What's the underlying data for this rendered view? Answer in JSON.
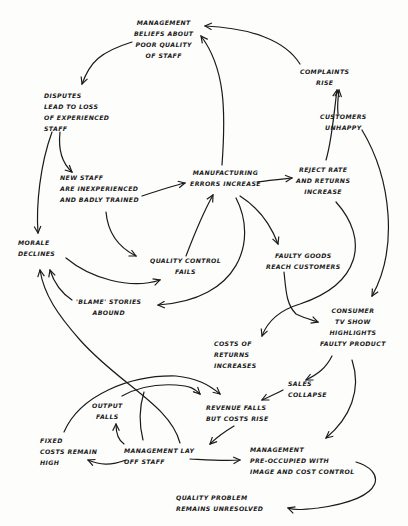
{
  "diagram": {
    "type": "causal-loop sketch",
    "nodes": [
      {
        "id": "mgmt_beliefs",
        "label": "Management\nbeliefs about\npoor quality\nof staff"
      },
      {
        "id": "disputes",
        "label": "Disputes\nlead to loss\nof experienced\nstaff"
      },
      {
        "id": "complaints",
        "label": "Complaints\nrise"
      },
      {
        "id": "customers",
        "label": "Customers\nunhappy"
      },
      {
        "id": "new_staff",
        "label": "New staff\nare inexperienced\nand badly trained"
      },
      {
        "id": "mfg_errors",
        "label": "Manufacturing\nerrors increase"
      },
      {
        "id": "reject_rate",
        "label": "Reject rate\nand returns\nincrease"
      },
      {
        "id": "morale",
        "label": "Morale\ndeclines"
      },
      {
        "id": "qc_fails",
        "label": "Quality control\nfails"
      },
      {
        "id": "faulty_goods",
        "label": "Faulty goods\nreach customers"
      },
      {
        "id": "blame",
        "label": "'Blame' stories\nabound"
      },
      {
        "id": "tv_show",
        "label": "Consumer\nTV show\nhighlights\nfaulty product"
      },
      {
        "id": "costs_returns",
        "label": "Costs of\nreturns\nincreases"
      },
      {
        "id": "sales",
        "label": "Sales\ncollapse"
      },
      {
        "id": "output",
        "label": "Output\nfalls"
      },
      {
        "id": "revenue",
        "label": "Revenue falls\nbut costs rise"
      },
      {
        "id": "fixed_costs",
        "label": "Fixed\ncosts remain\nhigh"
      },
      {
        "id": "layoff",
        "label": "Management lay\noff staff"
      },
      {
        "id": "preoccupied",
        "label": "Management\npre-occupied with\nimage and cost control"
      },
      {
        "id": "unresolved",
        "label": "Quality problem\nremains unresolved"
      }
    ],
    "edges": [
      [
        "mgmt_beliefs",
        "disputes"
      ],
      [
        "disputes",
        "new_staff"
      ],
      [
        "disputes",
        "morale"
      ],
      [
        "new_staff",
        "mfg_errors"
      ],
      [
        "new_staff",
        "qc_fails"
      ],
      [
        "qc_fails",
        "mfg_errors"
      ],
      [
        "mfg_errors",
        "mgmt_beliefs"
      ],
      [
        "mfg_errors",
        "reject_rate"
      ],
      [
        "mfg_errors",
        "faulty_goods"
      ],
      [
        "mfg_errors",
        "blame"
      ],
      [
        "reject_rate",
        "complaints"
      ],
      [
        "complaints",
        "mgmt_beliefs"
      ],
      [
        "customers",
        "complaints"
      ],
      [
        "customers",
        "tv_show"
      ],
      [
        "reject_rate",
        "costs_returns"
      ],
      [
        "morale",
        "qc_fails"
      ],
      [
        "blame",
        "morale"
      ],
      [
        "faulty_goods",
        "tv_show"
      ],
      [
        "tv_show",
        "sales"
      ],
      [
        "tv_show",
        "preoccupied"
      ],
      [
        "sales",
        "revenue"
      ],
      [
        "revenue",
        "layoff"
      ],
      [
        "layoff",
        "fixed_costs"
      ],
      [
        "layoff",
        "output"
      ],
      [
        "layoff",
        "preoccupied"
      ],
      [
        "layoff",
        "morale"
      ],
      [
        "output",
        "revenue"
      ],
      [
        "fixed_costs",
        "revenue"
      ],
      [
        "preoccupied",
        "unresolved"
      ]
    ]
  }
}
